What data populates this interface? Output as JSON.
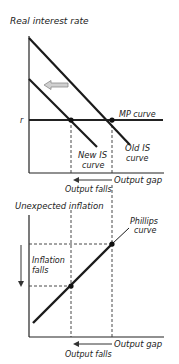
{
  "top_panel": {
    "y_axis_label": "Real interest rate",
    "r_label": "r",
    "mp_label": "MP curve",
    "old_is_label_line1": "Old IS",
    "old_is_label_line2": "curve",
    "new_is_label_line1": "New IS",
    "new_is_label_line2": "curve",
    "x_axis_label": "Output gap",
    "output_falls": "Output falls"
  },
  "bottom_panel": {
    "y_axis_label": "Unexpected inflation",
    "phillips_label_line1": "Phillips",
    "phillips_label_line2": "curve",
    "inflation_falls_line1": "Inflation",
    "inflation_falls_line2": "falls",
    "x_axis_label": "Output gap",
    "output_falls": "Output falls"
  },
  "colors": {
    "line": "#1a1a1a",
    "dashed": "#333333",
    "shift_arrow": "#9a9a9a"
  }
}
